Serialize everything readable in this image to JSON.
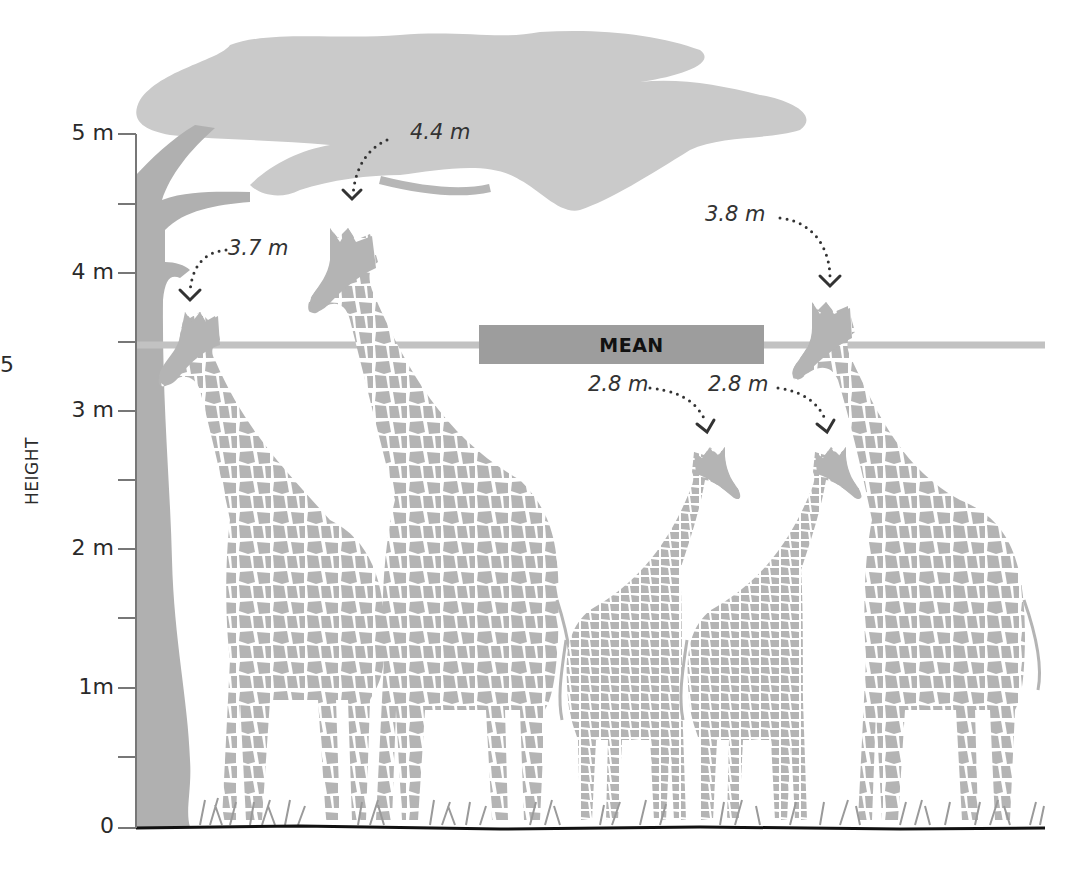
{
  "figure": {
    "y_axis": {
      "title": "HEIGHT",
      "ticks": [
        {
          "label": "5 m",
          "value": 5
        },
        {
          "label": "4 m",
          "value": 4
        },
        {
          "label": "3 m",
          "value": 3
        },
        {
          "label": "2 m",
          "value": 2
        },
        {
          "label": "1m",
          "value": 1
        },
        {
          "label": "0",
          "value": 0
        }
      ],
      "minor_ticks": [
        4.5,
        3.5,
        2.5,
        1.5,
        0.5
      ],
      "cropped_edge_label": "5"
    },
    "mean": {
      "label": "MEAN",
      "value": 3.5
    },
    "giraffes": [
      {
        "id": "giraffe-1",
        "height_label": "3.7 m",
        "height": 3.7
      },
      {
        "id": "giraffe-2",
        "height_label": "4.4 m",
        "height": 4.4
      },
      {
        "id": "giraffe-3",
        "height_label": "2.8 m",
        "height": 2.8
      },
      {
        "id": "giraffe-4",
        "height_label": "2.8 m",
        "height": 2.8
      },
      {
        "id": "giraffe-5",
        "height_label": "3.8 m",
        "height": 3.8
      }
    ],
    "colors": {
      "giraffe": "#b4b4b4",
      "tree": "#c8c8c8",
      "trunk": "#b0b0b0",
      "mean_line": "#c2c2c2",
      "mean_badge": "#9d9d9d",
      "axis": "#777777",
      "ground": "#111111",
      "arrow": "#333333"
    }
  }
}
